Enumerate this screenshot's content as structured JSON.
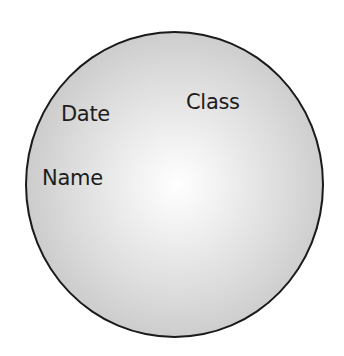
{
  "diagram": {
    "shape": "circle",
    "colors": {
      "outline": "#1a1a1a",
      "fill_center": "#ffffff",
      "fill_edge": "#c3c3c3",
      "text": "#1c1c1c"
    },
    "labels": {
      "date": "Date",
      "class": "Class",
      "name": "Name"
    }
  }
}
